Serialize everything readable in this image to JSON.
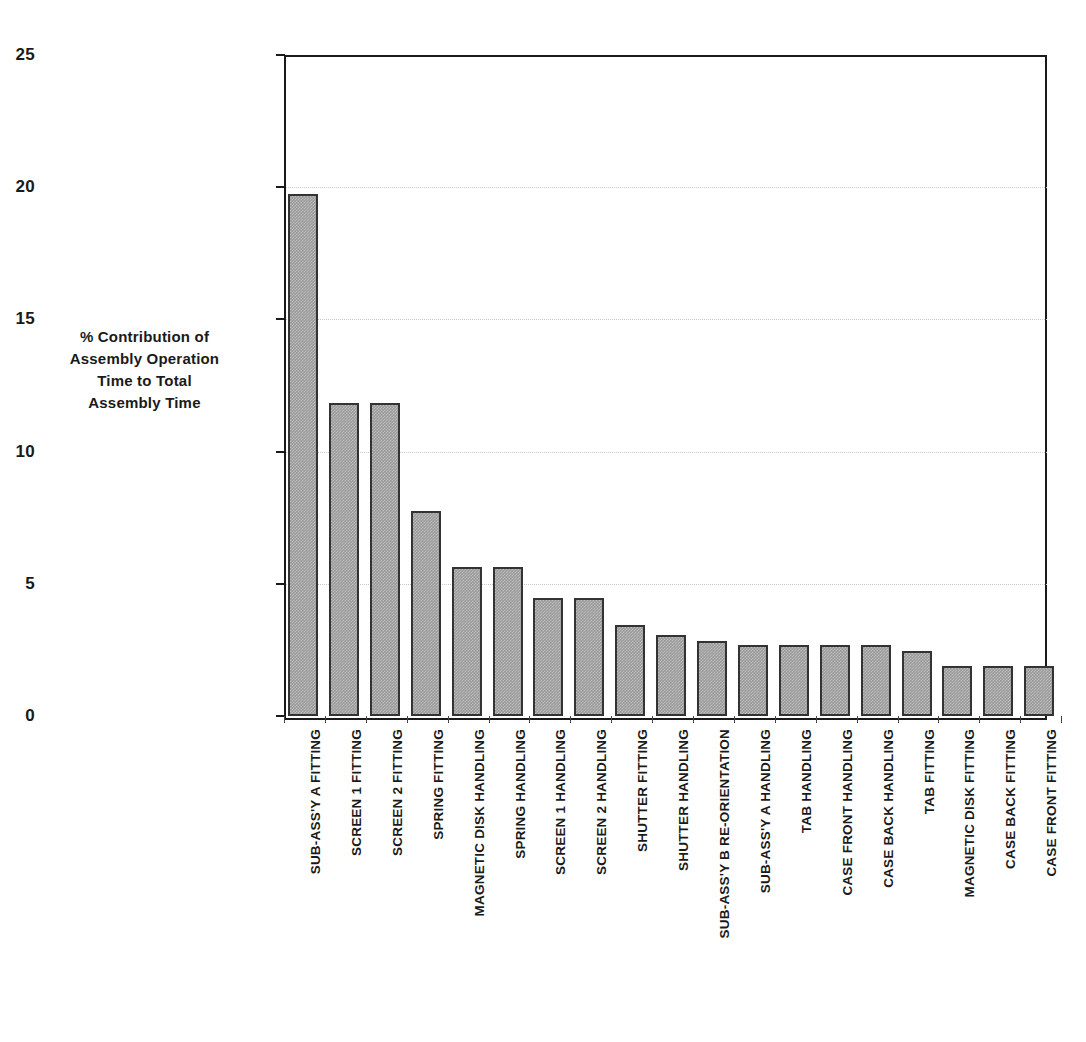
{
  "chart_data": {
    "type": "bar",
    "title": "",
    "xlabel": "",
    "ylabel_lines": [
      "% Contribution of",
      "Assembly Operation",
      "Time to Total",
      "Assembly Time"
    ],
    "ylabel": "% Contribution of Assembly Operation Time to Total Assembly Time",
    "ylim": [
      0,
      25
    ],
    "yticks": [
      0,
      5,
      10,
      15,
      20,
      25
    ],
    "ytick_labels": [
      "0",
      "5",
      "10",
      "15",
      "20",
      "25"
    ],
    "grid": "horizontal-dotted",
    "legend": "none",
    "bar_fill_color": "#9a9a9a",
    "bar_edge_color": "#333333",
    "axis_color": "#1a1a1a",
    "gridline_color": "#c9c9c9",
    "categories": [
      "SUB-ASS'Y A FITTING",
      "SCREEN 1 FITTING",
      "SCREEN 2 FITTING",
      "SPRING FITTING",
      "MAGNETIC DISK HANDLING",
      "SPRING HANDLING",
      "SCREEN 1 HANDLING",
      "SCREEN 2 HANDLING",
      "SHUTTER FITTING",
      "SHUTTER HANDLING",
      "SUB-ASS'Y B RE-ORIENTATION",
      "SUB-ASS'Y A HANDLING",
      "TAB HANDLING",
      "CASE FRONT HANDLING",
      "CASE BACK HANDLING",
      "TAB FITTING",
      "MAGNETIC DISK FITTING",
      "CASE BACK FITTING",
      "CASE FRONT FITTING"
    ],
    "values": [
      19.75,
      11.85,
      11.85,
      7.75,
      5.65,
      5.65,
      4.45,
      4.45,
      3.45,
      3.05,
      2.85,
      2.7,
      2.7,
      2.7,
      2.7,
      2.45,
      1.9,
      1.9,
      1.9
    ]
  }
}
